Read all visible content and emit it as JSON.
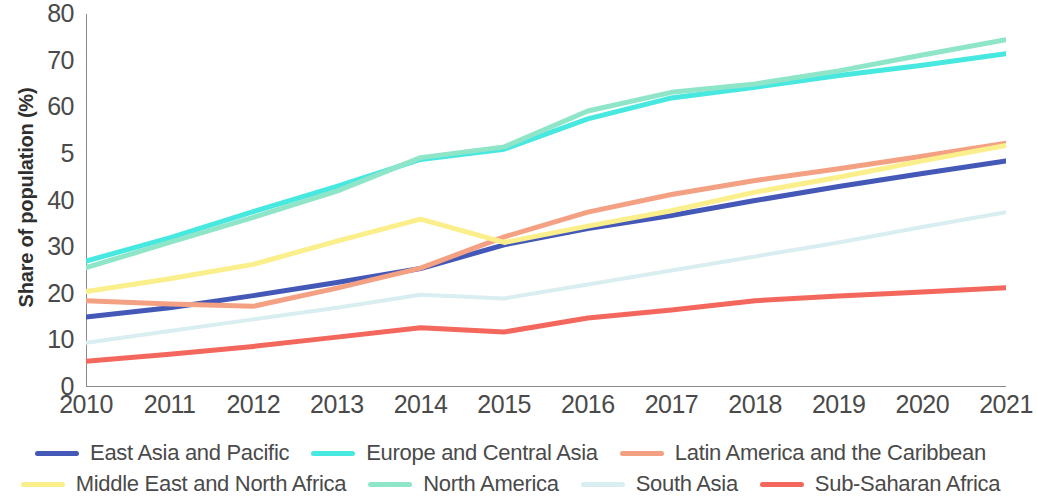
{
  "chart_data": {
    "type": "line",
    "title": "",
    "xlabel": "",
    "ylabel": "Share of population (%)",
    "x": [
      2010,
      2011,
      2012,
      2013,
      2014,
      2015,
      2016,
      2017,
      2018,
      2019,
      2020,
      2021
    ],
    "categories": [
      "2010",
      "2011",
      "2012",
      "2013",
      "2014",
      "2015",
      "2016",
      "2017",
      "2018",
      "2019",
      "2020",
      "2021"
    ],
    "xlim": [
      2010,
      2021
    ],
    "ylim": [
      0,
      80
    ],
    "yticks": [
      0,
      10,
      20,
      30,
      40,
      50,
      60,
      70,
      80
    ],
    "ytick_labels": [
      "0",
      "10",
      "20",
      "30",
      "40",
      "5",
      "60",
      "70",
      "80"
    ],
    "grid": false,
    "legend_position": "bottom",
    "series": [
      {
        "name": "East Asia and Pacific",
        "color": "#4458b8",
        "width": 5,
        "values": [
          15.0,
          17.0,
          19.6,
          22.4,
          25.4,
          30.5,
          34.0,
          36.8,
          40.0,
          43.0,
          45.8,
          48.5
        ]
      },
      {
        "name": "Europe and Central Asia",
        "color": "#46e8e0",
        "width": 5,
        "values": [
          27.0,
          32.0,
          37.6,
          43.0,
          48.8,
          51.0,
          57.5,
          62.0,
          64.3,
          66.8,
          69.0,
          71.5
        ]
      },
      {
        "name": "Latin America and the Caribbean",
        "color": "#f4a183",
        "width": 5,
        "values": [
          18.5,
          17.8,
          17.3,
          21.2,
          25.5,
          32.2,
          37.5,
          41.3,
          44.3,
          46.8,
          49.5,
          52.3
        ]
      },
      {
        "name": "Middle East and North Africa",
        "color": "#faef8a",
        "width": 5,
        "values": [
          20.5,
          23.2,
          26.3,
          31.3,
          36.0,
          31.0,
          34.5,
          37.8,
          41.8,
          45.0,
          48.5,
          51.8
        ]
      },
      {
        "name": "North America",
        "color": "#8fe5c8",
        "width": 5,
        "values": [
          25.6,
          31.0,
          36.4,
          42.0,
          49.2,
          51.5,
          59.2,
          63.2,
          65.0,
          67.8,
          71.2,
          74.5
        ]
      },
      {
        "name": "South Asia",
        "color": "#d8eef0",
        "width": 4,
        "values": [
          9.5,
          12.0,
          14.5,
          17.0,
          19.8,
          19.0,
          22.0,
          25.0,
          28.0,
          31.0,
          34.3,
          37.5
        ]
      },
      {
        "name": "Sub-Saharan Africa",
        "color": "#f4675c",
        "width": 5,
        "values": [
          5.5,
          7.0,
          8.7,
          10.7,
          12.7,
          11.8,
          14.8,
          16.5,
          18.5,
          19.5,
          20.4,
          21.3
        ]
      }
    ]
  },
  "legend": {
    "rows": [
      [
        "East Asia and Pacific",
        "Europe and Central Asia",
        "Latin America and the Caribbean"
      ],
      [
        "Middle East and North Africa",
        "North America",
        "South Asia",
        "Sub-Saharan Africa"
      ]
    ]
  },
  "axis": {
    "line_color": "#8a8a8a"
  }
}
